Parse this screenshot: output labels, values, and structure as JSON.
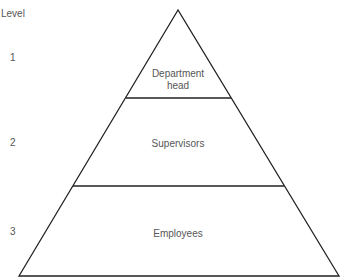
{
  "axis_label": "Level",
  "levels": [
    {
      "number": "1",
      "label_line1": "Department",
      "label_line2": "head"
    },
    {
      "number": "2",
      "label_line1": "Supervisors"
    },
    {
      "number": "3",
      "label_line1": "Employees"
    }
  ],
  "colors": {
    "line": "#222222",
    "text": "#555555",
    "background": "#ffffff"
  }
}
